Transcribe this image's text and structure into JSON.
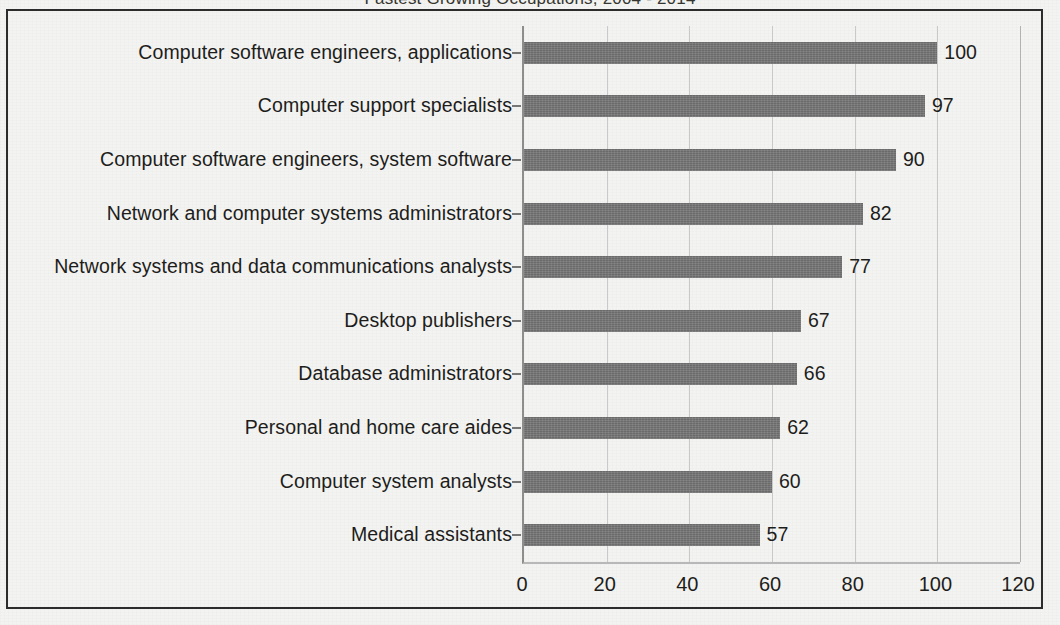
{
  "figure": {
    "frame_border_color": "#2c2c2c",
    "background_color": "#f3f3f1",
    "title_remnant": "Fastest Growing Occupations, 2004 - 2014"
  },
  "chart_data": {
    "type": "bar",
    "orientation": "horizontal",
    "title": "",
    "xlabel": "",
    "ylabel": "",
    "xlim": [
      0,
      120
    ],
    "xticks": [
      0,
      20,
      40,
      60,
      80,
      100,
      120
    ],
    "xtick_labels": [
      "0",
      "20",
      "40",
      "60",
      "80",
      "100",
      "120"
    ],
    "grid": true,
    "grid_axis": "x",
    "legend": false,
    "bar_color": "#757575",
    "categories": [
      "Computer software engineers, applications",
      "Computer support specialists",
      "Computer software engineers, system software",
      "Network and computer systems administrators",
      "Network systems and data communications analysts",
      "Desktop publishers",
      "Database administrators",
      "Personal and home care aides",
      "Computer system analysts",
      "Medical assistants"
    ],
    "values": [
      100,
      97,
      90,
      82,
      77,
      67,
      66,
      62,
      60,
      57
    ],
    "value_labels": [
      "100",
      "97",
      "90",
      "82",
      "77",
      "67",
      "66",
      "62",
      "60",
      "57"
    ]
  }
}
